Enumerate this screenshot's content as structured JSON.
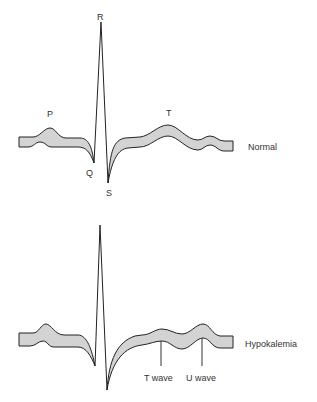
{
  "figure": {
    "normal": {
      "name": "Normal",
      "labels": {
        "p": "P",
        "q": "Q",
        "r": "R",
        "s": "S",
        "t": "T"
      }
    },
    "hypokalemia": {
      "name": "Hypokalemia",
      "labels": {
        "t_wave": "T wave",
        "u_wave": "U wave"
      }
    },
    "colors": {
      "band_fill": "#d3d3d3",
      "stroke": "#222222",
      "text": "#333333"
    }
  }
}
